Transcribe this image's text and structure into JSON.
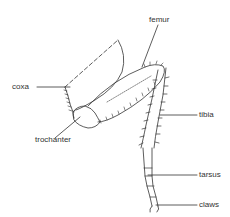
{
  "diagram": {
    "labels": {
      "coxa": "coxa",
      "femur": "femur",
      "trochanter": "trochanter",
      "tibia": "tibia",
      "tarsus": "tarsus",
      "claws": "claws"
    },
    "colors": {
      "line": "#333333",
      "background": "#ffffff"
    }
  }
}
